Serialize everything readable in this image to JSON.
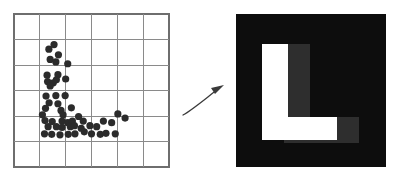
{
  "figure": {
    "title": "",
    "caption": "",
    "background_color": "#ffffff"
  },
  "scatter_panel": {
    "name": "scatter-grid-panel",
    "frame": {
      "x": 14,
      "y": 14,
      "width": 155,
      "height": 153
    },
    "grid": {
      "columns": 6,
      "rows": 6,
      "line_color": "#8a8a8a",
      "frame_color": "#6e6e6e",
      "show_grid": true,
      "show_ticks": false,
      "show_axis_labels": false
    },
    "dot": {
      "radius": 3.6,
      "color": "#2b2b2b",
      "count": 52
    }
  },
  "arrow": {
    "name": "transform-arrow",
    "label": "",
    "color": "#3a3a3a",
    "direction": "right-up",
    "start": {
      "x": 183,
      "y": 114
    },
    "end": {
      "x": 223,
      "y": 86
    }
  },
  "image_panel": {
    "name": "rendered-image-panel",
    "frame": {
      "x": 236,
      "y": 14,
      "width": 150,
      "height": 153
    },
    "background_color": "#0d0d0d",
    "shape": {
      "letter": "L",
      "main_color": "#ffffff",
      "shadow_color": "#2e2e2e",
      "shadow_offset": {
        "x": 22,
        "y": 22
      }
    }
  },
  "chart_data": {
    "type": "scatter",
    "title": "",
    "subtitle": "",
    "xlabel": "",
    "ylabel": "",
    "xlim": [
      0,
      6
    ],
    "ylim": [
      0,
      6
    ],
    "grid": true,
    "legend": null,
    "annotations": [
      {
        "text": "",
        "type": "arrow",
        "from": "scatter-grid-panel",
        "to": "rendered-image-panel"
      }
    ],
    "points": [
      [
        1.35,
        4.62
      ],
      [
        1.72,
        4.4
      ],
      [
        1.4,
        4.22
      ],
      [
        1.62,
        4.12
      ],
      [
        2.08,
        4.05
      ],
      [
        1.28,
        3.6
      ],
      [
        1.7,
        3.62
      ],
      [
        1.3,
        3.35
      ],
      [
        1.52,
        3.3
      ],
      [
        1.64,
        3.42
      ],
      [
        1.4,
        3.18
      ],
      [
        2.0,
        3.45
      ],
      [
        1.24,
        2.78
      ],
      [
        1.62,
        2.8
      ],
      [
        1.98,
        2.8
      ],
      [
        1.36,
        2.52
      ],
      [
        1.7,
        2.48
      ],
      [
        1.22,
        2.3
      ],
      [
        1.82,
        2.22
      ],
      [
        2.22,
        2.32
      ],
      [
        1.2,
        1.82
      ],
      [
        1.48,
        1.78
      ],
      [
        1.86,
        1.8
      ],
      [
        2.08,
        1.74
      ],
      [
        2.26,
        1.8
      ],
      [
        1.32,
        1.58
      ],
      [
        1.64,
        1.58
      ],
      [
        1.86,
        1.55
      ],
      [
        2.18,
        1.58
      ],
      [
        2.34,
        1.62
      ],
      [
        1.18,
        1.3
      ],
      [
        1.46,
        1.28
      ],
      [
        1.78,
        1.26
      ],
      [
        2.1,
        1.28
      ],
      [
        2.36,
        1.3
      ],
      [
        2.68,
        1.8
      ],
      [
        2.6,
        1.52
      ],
      [
        2.72,
        1.38
      ],
      [
        3.0,
        1.3
      ],
      [
        3.34,
        1.28
      ],
      [
        2.94,
        1.62
      ],
      [
        3.46,
        1.8
      ],
      [
        3.78,
        1.74
      ],
      [
        4.02,
        2.08
      ],
      [
        4.3,
        1.92
      ],
      [
        3.56,
        1.32
      ],
      [
        3.92,
        1.3
      ],
      [
        1.55,
        4.8
      ],
      [
        1.9,
        2.05
      ],
      [
        2.5,
        1.98
      ],
      [
        1.1,
        2.05
      ],
      [
        3.2,
        1.58
      ]
    ]
  }
}
